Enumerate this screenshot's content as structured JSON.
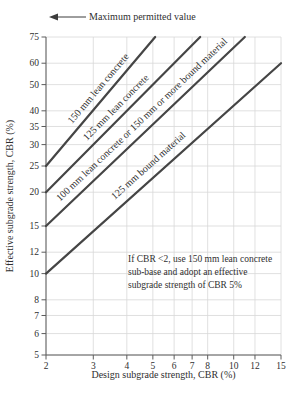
{
  "figure": {
    "max_permitted_label": "Maximum permitted value"
  },
  "chart_data": {
    "type": "line",
    "title": "",
    "xlabel": "Design subgrade strength, CBR (%)",
    "ylabel": "Effective subgrade strength, CBR (%)",
    "x_scale": "log",
    "y_scale": "log",
    "xlim": [
      2,
      15
    ],
    "ylim": [
      5,
      75
    ],
    "x_ticks": [
      2,
      3,
      4,
      5,
      6,
      7,
      8,
      10,
      12,
      15
    ],
    "y_ticks": [
      5,
      6,
      7,
      8,
      10,
      12,
      15,
      20,
      25,
      30,
      35,
      40,
      50,
      60,
      75
    ],
    "grid": true,
    "legend_position": "labels-on-lines",
    "series": [
      {
        "name": "150 mm lean concrete",
        "points": [
          [
            2,
            25
          ],
          [
            5.1,
            75
          ]
        ]
      },
      {
        "name": "125 mm lean concrete",
        "points": [
          [
            2,
            20
          ],
          [
            7.5,
            75
          ]
        ]
      },
      {
        "name": "100 mm lean concrete or 150 mm or more bound material",
        "points": [
          [
            2,
            15
          ],
          [
            11,
            75
          ]
        ]
      },
      {
        "name": "125 mm bound material",
        "points": [
          [
            2,
            10
          ],
          [
            15,
            60
          ]
        ]
      }
    ],
    "annotations": {
      "max_permitted": "Maximum permitted value",
      "note_lines": [
        "If CBR <2, use 150 mm lean concrete",
        "sub-base and adopt an effective",
        "subgrade strength of CBR 5%"
      ]
    },
    "colors": {
      "line": "#454545",
      "grid": "#d8d8d8",
      "axis": "#5c5c5c",
      "text": "#2f2f2f"
    }
  }
}
